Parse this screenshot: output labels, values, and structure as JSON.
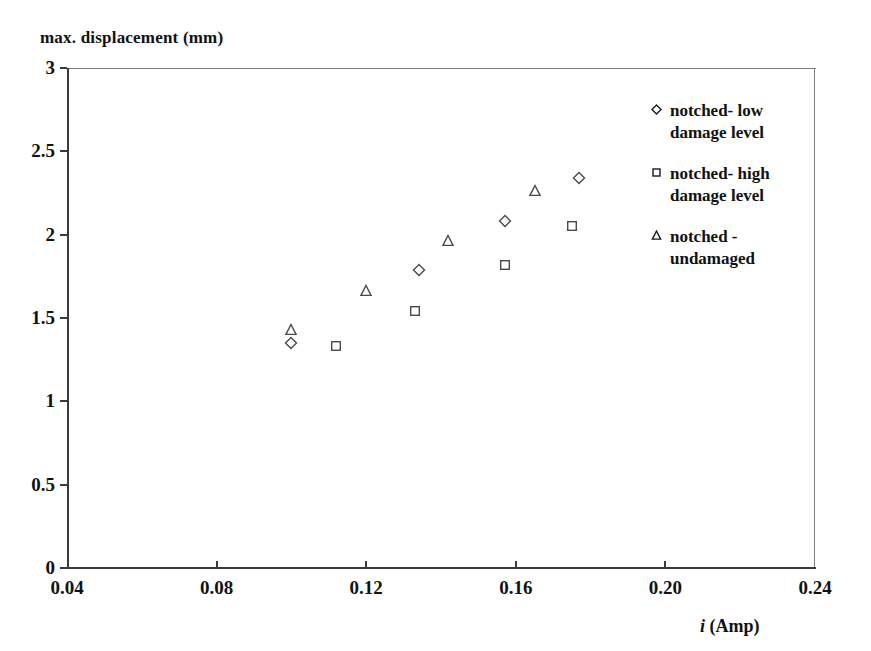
{
  "chart_data": {
    "type": "scatter",
    "title": "",
    "xlabel": "i (Amp)",
    "ylabel": "max. displacement (mm)",
    "xlim": [
      0.04,
      0.24
    ],
    "ylim": [
      0,
      3
    ],
    "xticks": [
      "0.04",
      "0.08",
      "0.12",
      "0.16",
      "0.20",
      "0.24"
    ],
    "xtick_values": [
      0.04,
      0.08,
      0.12,
      0.16,
      0.2,
      0.24
    ],
    "yticks": [
      "0",
      "0.5",
      "1",
      "1.5",
      "2",
      "2.5",
      "3"
    ],
    "ytick_values": [
      0,
      0.5,
      1,
      1.5,
      2,
      2.5,
      3
    ],
    "grid": false,
    "legend_position": "upper right",
    "series": [
      {
        "name": "notched- low\ndamage level",
        "marker": "diamond",
        "points": [
          {
            "x": 0.1,
            "y": 1.35
          },
          {
            "x": 0.134,
            "y": 1.79
          },
          {
            "x": 0.157,
            "y": 2.08
          },
          {
            "x": 0.177,
            "y": 2.34
          }
        ]
      },
      {
        "name": "notched- high\ndamage level",
        "marker": "square",
        "points": [
          {
            "x": 0.112,
            "y": 1.33
          },
          {
            "x": 0.133,
            "y": 1.54
          },
          {
            "x": 0.157,
            "y": 1.82
          },
          {
            "x": 0.175,
            "y": 2.05
          }
        ]
      },
      {
        "name": "notched -\nundamaged",
        "marker": "triangle",
        "points": [
          {
            "x": 0.1,
            "y": 1.43
          },
          {
            "x": 0.12,
            "y": 1.66
          },
          {
            "x": 0.142,
            "y": 1.96
          },
          {
            "x": 0.165,
            "y": 2.26
          }
        ]
      }
    ]
  },
  "legend": {
    "entries": [
      {
        "label": "notched- low\ndamage level",
        "marker": "diamond"
      },
      {
        "label": "notched- high\ndamage level",
        "marker": "square"
      },
      {
        "label": "notched -\nundamaged",
        "marker": "triangle"
      }
    ]
  }
}
